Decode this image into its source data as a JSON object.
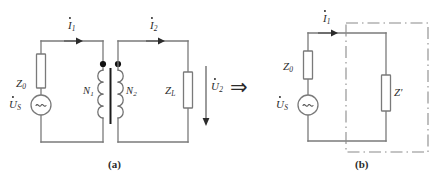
{
  "figure": {
    "panels": [
      {
        "id": "a",
        "caption": "(a)",
        "labels": {
          "source_impedance": "Z",
          "source_impedance_sub": "0",
          "source_voltage": "U",
          "source_voltage_sub": "S",
          "primary_turns": "N",
          "primary_turns_sub": "1",
          "secondary_turns": "N",
          "secondary_turns_sub": "2",
          "load_impedance": "Z",
          "load_impedance_sub": "L",
          "primary_current": "I",
          "primary_current_sub": "1",
          "secondary_current": "I",
          "secondary_current_sub": "2",
          "output_voltage": "U",
          "output_voltage_sub": "2"
        },
        "source_symbol": "~"
      },
      {
        "id": "b",
        "caption": "(b)",
        "labels": {
          "source_impedance": "Z",
          "source_impedance_sub": "0",
          "source_voltage": "U",
          "source_voltage_sub": "S",
          "reflected_impedance": "Z'",
          "primary_current": "I",
          "primary_current_sub": "1"
        },
        "source_symbol": "~"
      }
    ],
    "transform_arrow": "⇒",
    "colors": {
      "wire": "#7a7a7a",
      "ink": "#2b2b2b",
      "dot": "#111111",
      "core": "#1c1c1c",
      "dashdot": "#8a8a8a",
      "background": "#ffffff"
    }
  }
}
